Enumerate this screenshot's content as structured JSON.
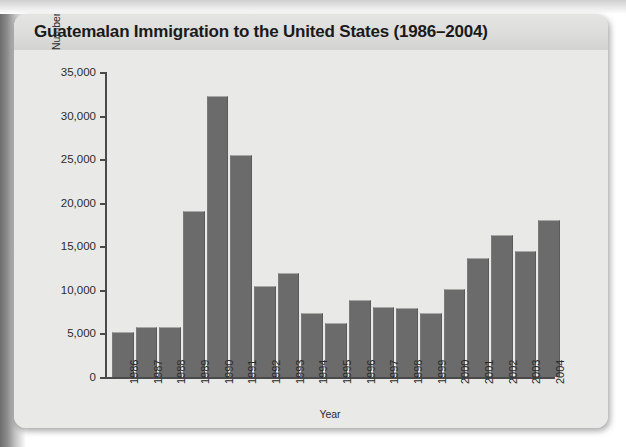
{
  "card": {
    "title": "Guatemalan Immigration to the United States (1986–2004)"
  },
  "colors": {
    "bar": "#6b6b6b",
    "panel": "#e9e9e7",
    "title_band": "#dcdcda",
    "axis": "#4a4a4a",
    "text": "#2b2b2b",
    "page": "#ffffff"
  },
  "chart_data": {
    "type": "bar",
    "title": "Guatemalan Immigration to the United States (1986–2004)",
    "xlabel": "Year",
    "ylabel": "Number of People",
    "ylim": [
      0,
      35000
    ],
    "ytick_values": [
      0,
      5000,
      10000,
      15000,
      20000,
      25000,
      30000,
      35000
    ],
    "ytick_labels": [
      "0",
      "5,000",
      "10,000",
      "15,000",
      "20,000",
      "25,000",
      "30,000",
      "35,000"
    ],
    "grid": false,
    "legend": null,
    "categories": [
      "1986",
      "1987",
      "1988",
      "1989",
      "1990",
      "1991",
      "1992",
      "1993",
      "1994",
      "1995",
      "1996",
      "1997",
      "1998",
      "1999",
      "2000",
      "2001",
      "2002",
      "2003",
      "2004"
    ],
    "values": [
      5200,
      5700,
      5700,
      19000,
      32300,
      25500,
      10500,
      11900,
      7400,
      6200,
      8800,
      8000,
      7900,
      7400,
      10100,
      13700,
      16300,
      14500,
      18000
    ]
  }
}
